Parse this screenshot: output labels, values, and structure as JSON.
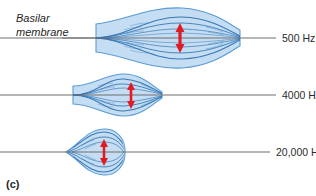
{
  "figure": {
    "panel_label": "(c)",
    "membrane_label_line1": "Basilar",
    "membrane_label_line2": "membrane",
    "colors": {
      "envelope_fill": "#c5ddf2",
      "envelope_stroke": "#5b9bd5",
      "wave_line": "#2f74b5",
      "axis_line": "#6e6e6e",
      "arrow_red": "#e01b24",
      "background": "#ffffff",
      "text": "#2b2b2b"
    },
    "rows": [
      {
        "name": "low-frequency-row",
        "frequency_label": "500 Hz",
        "axis_y": 38,
        "envelope_left": 96,
        "envelope_right": 240,
        "peak_x": 180,
        "peak_height": 30,
        "arrow_height": 30,
        "shape": "broad-lens"
      },
      {
        "name": "mid-frequency-row",
        "frequency_label": "4000 Hz",
        "axis_y": 95,
        "envelope_left": 73,
        "envelope_right": 162,
        "peak_x": 131,
        "peak_height": 20,
        "arrow_height": 24,
        "shape": "narrow-spindle"
      },
      {
        "name": "high-frequency-row",
        "frequency_label": "20,000 Hz",
        "axis_y": 152,
        "envelope_left": 66,
        "envelope_right": 124,
        "peak_x": 104,
        "peak_height": 22,
        "arrow_height": 22,
        "shape": "teardrop"
      }
    ],
    "leader_line": {
      "name": "basilar-membrane-leader",
      "x1": 62,
      "y1": 38,
      "x2": 96,
      "y2": 38
    }
  }
}
